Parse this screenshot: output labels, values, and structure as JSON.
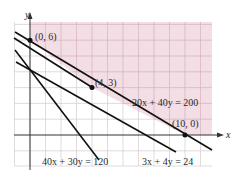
{
  "figure": {
    "colors": {
      "region": "#f4dfe6",
      "grid": "#cfc6c9",
      "region_grid": "#d9b9c5",
      "axis": "#333333",
      "line": "#111111",
      "text": "#2a2a2a"
    },
    "axes": {
      "x_label": "x",
      "y_label": "y",
      "x_range": [
        -1,
        12
      ],
      "y_range": [
        -2,
        7
      ],
      "grid_step": 1
    },
    "lines": [
      {
        "id": "l1",
        "label": "40x + 30y = 120",
        "intercepts": {
          "x": 3,
          "y": 4
        }
      },
      {
        "id": "l2",
        "label": "3x + 4y = 24",
        "intercepts": {
          "x": 8,
          "y": 6
        }
      },
      {
        "id": "l3",
        "label": "20x + 40y = 200",
        "intercepts": {
          "x": 10,
          "y": 5
        }
      }
    ],
    "points": [
      {
        "label": "(0, 6)",
        "x": 0,
        "y": 6
      },
      {
        "label": "(4, 3)",
        "x": 4,
        "y": 3
      },
      {
        "label": "(10, 0)",
        "x": 10,
        "y": 0
      }
    ],
    "region": {
      "description": "Shaded feasible region above (0,6)-(4,3)-(10,0)",
      "vertices": [
        [
          0,
          6
        ],
        [
          4,
          3
        ],
        [
          10,
          0
        ]
      ]
    }
  }
}
